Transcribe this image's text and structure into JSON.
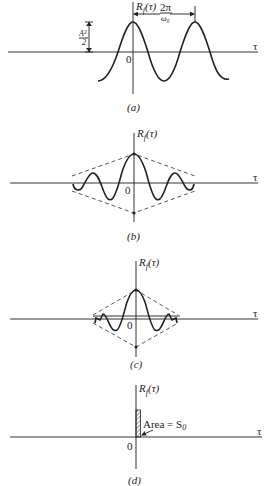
{
  "panels": [
    {
      "id": "a",
      "caption": "(a)",
      "ylabel": "R_f(τ)",
      "xlabel": "τ",
      "origin": "0",
      "annotations": {
        "amplitude": "A²/2",
        "period": "2π/ω₀"
      },
      "description": "Cosine autocorrelation: periodic, amplitude A²/2, period 2π/ω₀"
    },
    {
      "id": "b",
      "caption": "(b)",
      "ylabel": "R_f(τ)",
      "xlabel": "τ",
      "origin": "0",
      "description": "Damped oscillation with linear dashed envelope"
    },
    {
      "id": "c",
      "caption": "(c)",
      "ylabel": "R_f(τ)",
      "xlabel": "τ",
      "origin": "0",
      "description": "Narrower damped oscillation with steeper dashed envelope"
    },
    {
      "id": "d",
      "caption": "(d)",
      "ylabel": "R_f(τ)",
      "xlabel": "τ",
      "origin": "0",
      "annotations": {
        "area": "Area = S₀"
      },
      "description": "Impulse at origin (white noise autocorrelation) with area S₀"
    }
  ],
  "labels": {
    "a_ylabel_R": "R",
    "a_ylabel_sub": "f",
    "a_ylabel_arg": "(τ)",
    "tau": "τ",
    "zero": "0",
    "amp_num": "A²",
    "amp_den": "2",
    "per_num": "2π",
    "per_den": "ω₀",
    "cap_a": "(a)",
    "cap_b": "(b)",
    "cap_c": "(c)",
    "cap_d": "(d)",
    "area_text": "Area = S",
    "area_sub": "0"
  }
}
